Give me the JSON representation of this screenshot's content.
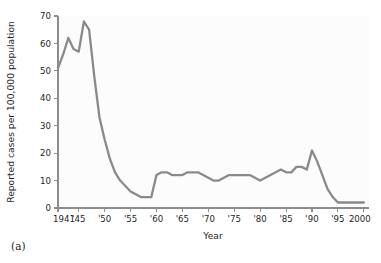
{
  "figure": {
    "panel_label": "(a)"
  },
  "chart_data": {
    "type": "line",
    "title": "",
    "xlabel": "Year",
    "ylabel": "Reported cases per 100,000 population",
    "xlim": [
      1941,
      2001
    ],
    "ylim": [
      0,
      70
    ],
    "grid": false,
    "legend": null,
    "line_color": "#8a8a8a",
    "axis_color": "#8c8c8c",
    "x_tick_labels": [
      "1941",
      "'45",
      "'50",
      "'55",
      "'60",
      "'65",
      "'70",
      "'75",
      "'80",
      "'85",
      "'90",
      "'95",
      "2000"
    ],
    "x_tick_values": [
      1941,
      1945,
      1950,
      1955,
      1960,
      1965,
      1970,
      1975,
      1980,
      1985,
      1990,
      1995,
      2000
    ],
    "y_tick_labels": [
      "0",
      "10",
      "20",
      "30",
      "40",
      "50",
      "60",
      "70"
    ],
    "y_tick_values": [
      0,
      10,
      20,
      30,
      40,
      50,
      60,
      70
    ],
    "series": [
      {
        "name": "Reported cases per 100,000 population",
        "x": [
          1941,
          1942,
          1943,
          1944,
          1945,
          1946,
          1947,
          1948,
          1949,
          1950,
          1951,
          1952,
          1953,
          1954,
          1955,
          1956,
          1957,
          1958,
          1959,
          1960,
          1961,
          1962,
          1963,
          1964,
          1965,
          1966,
          1967,
          1968,
          1969,
          1970,
          1971,
          1972,
          1973,
          1974,
          1975,
          1976,
          1977,
          1978,
          1979,
          1980,
          1981,
          1982,
          1983,
          1984,
          1985,
          1986,
          1987,
          1988,
          1989,
          1990,
          1991,
          1992,
          1993,
          1994,
          1995,
          1996,
          1997,
          1998,
          1999,
          2000
        ],
        "y": [
          51,
          56,
          62,
          58,
          57,
          68,
          65,
          48,
          33,
          25,
          18,
          13,
          10,
          8,
          6,
          5,
          4,
          4,
          4,
          12,
          13,
          13,
          12,
          12,
          12,
          13,
          13,
          13,
          12,
          11,
          10,
          10,
          11,
          12,
          12,
          12,
          12,
          12,
          11,
          10,
          11,
          12,
          13,
          14,
          13,
          13,
          15,
          15,
          14,
          21,
          17,
          12,
          7,
          4,
          2,
          2,
          2,
          2,
          2,
          2
        ]
      }
    ]
  }
}
